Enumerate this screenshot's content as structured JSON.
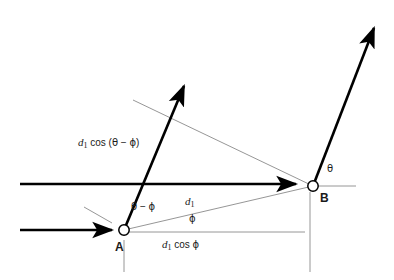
{
  "figure": {
    "kind": "geometry-vector-diagram",
    "title_visible": false,
    "background_color": "#ffffff",
    "bold_stroke_color": "#000000",
    "thin_stroke_color": "#8a8a8a",
    "text_color": "#1a1a1a",
    "width": 394,
    "height": 280
  },
  "points": [
    {
      "id": "A",
      "label": "A",
      "x": 124,
      "y": 230,
      "label_x": 115,
      "label_y": 241,
      "marker": "open-circle"
    },
    {
      "id": "B",
      "label": "B",
      "x": 313,
      "y": 186,
      "label_x": 320,
      "label_y": 192,
      "marker": "open-circle"
    }
  ],
  "labels": {
    "d1_cos_theta_minus_phi": {
      "text": "d1 cos (θ − ϕ)",
      "x": 78,
      "y": 143,
      "parts": {
        "d": "d",
        "sub": "1",
        "cos": "cos (",
        "theta": "θ",
        "minus": " − ",
        "phi": "ϕ",
        "close": ")"
      }
    },
    "d1": {
      "text": "d1",
      "x": 185,
      "y": 202,
      "parts": {
        "d": "d",
        "sub": "1"
      }
    },
    "d1_cos_phi": {
      "text": "d1 cos ϕ",
      "x": 162,
      "y": 245,
      "parts": {
        "d": "d",
        "sub": "1",
        "cos": "cos ",
        "phi": "ϕ"
      }
    },
    "theta_minus_phi": {
      "text": "θ − ϕ",
      "x": 131,
      "y": 207,
      "parts": {
        "theta": "θ",
        "minus": " − ",
        "phi": "ϕ"
      }
    },
    "phi": {
      "text": "ϕ",
      "x": 189,
      "y": 220
    },
    "theta": {
      "text": "θ",
      "x": 327,
      "y": 170
    },
    "point_a": {
      "text": "A"
    },
    "point_b": {
      "text": "B"
    }
  },
  "bold_elements": [
    {
      "name": "incident-ray-upper",
      "type": "line",
      "x1": 20,
      "y1": 184,
      "x2": 300,
      "y2": 184,
      "arrow": "end"
    },
    {
      "name": "incident-ray-lower",
      "type": "line",
      "x1": 20,
      "y1": 230,
      "x2": 116,
      "y2": 230,
      "arrow": "end"
    },
    {
      "name": "scattered-ray-from-a",
      "type": "line",
      "x1": 124,
      "y1": 230,
      "x2": 187,
      "y2": 79,
      "arrow": "end"
    },
    {
      "name": "scattered-ray-from-b",
      "type": "line",
      "x1": 313,
      "y1": 186,
      "x2": 377,
      "y2": 20,
      "arrow": "end"
    }
  ],
  "thin_elements": [
    {
      "name": "path-difference-line-upper",
      "type": "line",
      "x1": 133,
      "y1": 100,
      "x2": 313,
      "y2": 186
    },
    {
      "name": "wavefront-tick-at-a",
      "type": "line",
      "x1": 84,
      "y1": 207,
      "x2": 112,
      "y2": 223
    },
    {
      "name": "separation-line-d1",
      "type": "line",
      "x1": 124,
      "y1": 230,
      "x2": 313,
      "y2": 186
    },
    {
      "name": "baseline-from-a",
      "type": "line",
      "x1": 128,
      "y1": 232,
      "x2": 305,
      "y2": 232
    },
    {
      "name": "reference-axis-at-b",
      "type": "line",
      "x1": 317,
      "y1": 186,
      "x2": 356,
      "y2": 186
    },
    {
      "name": "drop-line-at-a",
      "type": "line",
      "x1": 124,
      "y1": 240,
      "x2": 124,
      "y2": 272
    },
    {
      "name": "drop-line-at-b",
      "type": "line",
      "x1": 310,
      "y1": 192,
      "x2": 310,
      "y2": 272
    }
  ]
}
